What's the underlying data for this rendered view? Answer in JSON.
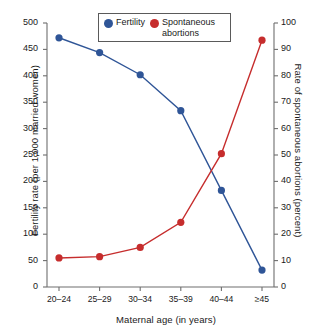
{
  "chart_data": {
    "type": "line",
    "title": "",
    "xlabel": "Maternal age (in years)",
    "categories": [
      "20–24",
      "25–29",
      "30–34",
      "35–39",
      "40–44",
      "≥45"
    ],
    "grid": false,
    "legend_position": "top-center",
    "series": [
      {
        "name": "Fertility",
        "axis": "left",
        "color": "#2f5597",
        "values": [
          472,
          444,
          402,
          334,
          183,
          32
        ]
      },
      {
        "name": "Spontaneous abortions",
        "axis": "right",
        "color": "#c62d2d",
        "values": [
          11,
          11.5,
          15,
          24.5,
          50.5,
          93.5
        ]
      }
    ],
    "axes": {
      "left": {
        "label": "Fertility rate (per 1,000 married women)",
        "ylim": [
          0,
          500
        ],
        "ticks": [
          0,
          50,
          100,
          150,
          200,
          250,
          300,
          350,
          400,
          450,
          500
        ],
        "tick_labels": [
          "0",
          "50",
          "100",
          "150",
          "200",
          "250",
          "300",
          "350",
          "400",
          "450",
          "500"
        ]
      },
      "right": {
        "label": "Rate of spontaneous abortions (percent)",
        "ylim": [
          0,
          100
        ],
        "ticks": [
          0,
          10,
          20,
          30,
          40,
          50,
          60,
          70,
          80,
          90,
          100
        ],
        "tick_labels": [
          "0",
          "10",
          "20",
          "30",
          "40",
          "50",
          "60",
          "70",
          "80",
          "90",
          "100"
        ]
      }
    }
  },
  "legend": {
    "items": [
      {
        "label": "Fertility",
        "color": "#2f5597"
      },
      {
        "label": "Spontaneous abortions",
        "color": "#c62d2d"
      }
    ]
  },
  "colors": {
    "fertility": "#2f5597",
    "abortions": "#c62d2d",
    "axis": "#6e6e6e",
    "text": "#1a1a1a",
    "background": "#ffffff"
  }
}
